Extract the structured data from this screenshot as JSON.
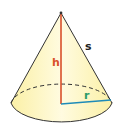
{
  "diagram": {
    "labels": {
      "height": "h",
      "slant": "s",
      "radius": "r"
    },
    "colors": {
      "fill": "#fdf6b9",
      "fill_light": "#fffbe0",
      "outline": "#333333",
      "height_line": "#d9502a",
      "radius_line": "#1e8bb8",
      "height_label": "#d9502a",
      "radius_label": "#2a9a6a",
      "slant_label": "#222222"
    }
  }
}
